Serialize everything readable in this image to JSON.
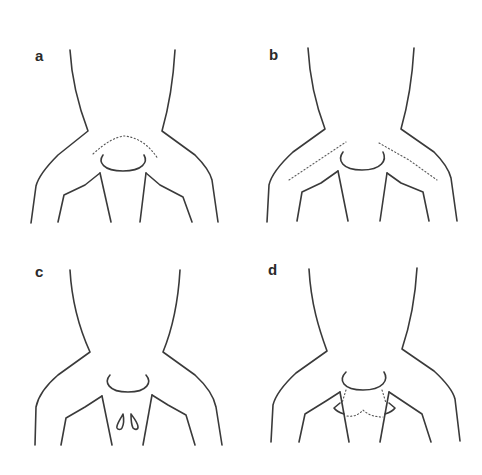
{
  "figure": {
    "panels": [
      {
        "label": "a",
        "description": "Neck and shoulders outline; dotted arc above collar"
      },
      {
        "label": "b",
        "description": "Neck and shoulders outline; dotted lines along both shoulders"
      },
      {
        "label": "c",
        "description": "Neck and shoulders outline; two teardrop shapes on chest"
      },
      {
        "label": "d",
        "description": "Neck and shoulders outline; triangular flaps with dotted outline below collar"
      }
    ]
  }
}
